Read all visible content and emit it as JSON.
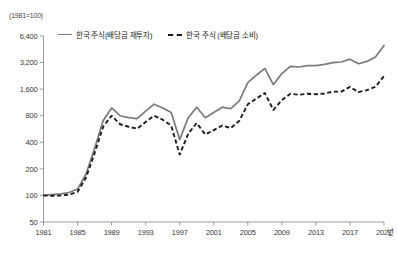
{
  "chart_data": {
    "type": "line",
    "title": "",
    "base_note": "(1981=100)",
    "xlabel": "년",
    "ylabel": "",
    "yscale": "log",
    "ylim": [
      50,
      6400
    ],
    "ytick_labels": [
      "6,400",
      "3,200",
      "1,600",
      "800",
      "400",
      "200",
      "100",
      "50"
    ],
    "ytick_values": [
      6400,
      3200,
      1600,
      800,
      400,
      200,
      100,
      50
    ],
    "xtick_labels": [
      "1981",
      "1985",
      "1989",
      "1993",
      "1997",
      "2001",
      "2005",
      "2009",
      "2013",
      "2017",
      "2021"
    ],
    "xtick_values": [
      1981,
      1985,
      1989,
      1993,
      1997,
      2001,
      2005,
      2009,
      2013,
      2017,
      2021
    ],
    "xlim": [
      1981,
      2021
    ],
    "grid": false,
    "legend_position": "top-left",
    "x": [
      1981,
      1982,
      1983,
      1984,
      1985,
      1986,
      1987,
      1988,
      1989,
      1990,
      1991,
      1992,
      1993,
      1994,
      1995,
      1996,
      1997,
      1998,
      1999,
      2000,
      2001,
      2002,
      2003,
      2004,
      2005,
      2006,
      2007,
      2008,
      2009,
      2010,
      2011,
      2012,
      2013,
      2014,
      2015,
      2016,
      2017,
      2018,
      2019,
      2020,
      2021
    ],
    "series": [
      {
        "name": "한국 주식(배당금 재투자)",
        "style": "solid",
        "color": "#7b7b7b",
        "values": [
          100,
          102,
          104,
          108,
          118,
          175,
          340,
          700,
          980,
          800,
          760,
          740,
          900,
          1080,
          980,
          870,
          430,
          760,
          1000,
          760,
          870,
          1000,
          960,
          1180,
          1900,
          2300,
          2750,
          1800,
          2400,
          2900,
          2850,
          2950,
          2950,
          3050,
          3200,
          3250,
          3500,
          3100,
          3300,
          3700,
          5000
        ]
      },
      {
        "name": "한국 주식 (배당금 소비)",
        "style": "dashed",
        "color": "#1c1c1c",
        "values": [
          100,
          99,
          100,
          102,
          110,
          160,
          300,
          600,
          800,
          640,
          600,
          570,
          680,
          800,
          720,
          620,
          290,
          500,
          660,
          490,
          550,
          620,
          580,
          700,
          1080,
          1250,
          1450,
          930,
          1200,
          1420,
          1380,
          1420,
          1400,
          1430,
          1500,
          1500,
          1700,
          1480,
          1560,
          1700,
          2250
        ]
      }
    ]
  }
}
